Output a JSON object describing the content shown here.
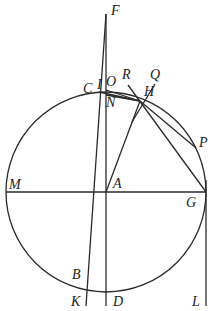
{
  "diagram": {
    "type": "geometry",
    "stroke_color": "#2a2a2a",
    "circle": {
      "center": "A",
      "cx": 106,
      "cy": 192,
      "r": 100
    },
    "points": {
      "F": {
        "x": 106,
        "y": 12
      },
      "C": {
        "x": 97,
        "y": 93
      },
      "I": {
        "x": 106,
        "y": 90
      },
      "O": {
        "x": 116,
        "y": 88
      },
      "R": {
        "x": 128,
        "y": 83
      },
      "Q": {
        "x": 154,
        "y": 82
      },
      "N": {
        "x": 106,
        "y": 94
      },
      "H": {
        "x": 140,
        "y": 101
      },
      "P": {
        "x": 196,
        "y": 148
      },
      "M": {
        "x": 6,
        "y": 192
      },
      "A": {
        "x": 106,
        "y": 192
      },
      "G": {
        "x": 206,
        "y": 192
      },
      "B": {
        "x": 87,
        "y": 280
      },
      "K": {
        "x": 86,
        "y": 306
      },
      "D": {
        "x": 106,
        "y": 306
      },
      "L": {
        "x": 206,
        "y": 306
      }
    },
    "labels": [
      {
        "text": "F",
        "x": 111,
        "y": 4
      },
      {
        "text": "C",
        "x": 83,
        "y": 82
      },
      {
        "text": "I",
        "x": 97,
        "y": 78
      },
      {
        "text": "O",
        "x": 106,
        "y": 75
      },
      {
        "text": "R",
        "x": 122,
        "y": 68
      },
      {
        "text": "Q",
        "x": 150,
        "y": 68
      },
      {
        "text": "N",
        "x": 106,
        "y": 96
      },
      {
        "text": "H",
        "x": 144,
        "y": 85
      },
      {
        "text": "P",
        "x": 199,
        "y": 136
      },
      {
        "text": "M",
        "x": 9,
        "y": 178
      },
      {
        "text": "A",
        "x": 113,
        "y": 177
      },
      {
        "text": "G",
        "x": 186,
        "y": 196
      },
      {
        "text": "B",
        "x": 72,
        "y": 268
      },
      {
        "text": "K",
        "x": 71,
        "y": 295
      },
      {
        "text": "D",
        "x": 113,
        "y": 295
      },
      {
        "text": "L",
        "x": 192,
        "y": 295
      }
    ]
  }
}
